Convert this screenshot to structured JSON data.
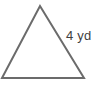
{
  "figure": {
    "background_color": "#ffffff",
    "shape": {
      "name": "triangle",
      "kind": "isosceles",
      "stroke_color": "#6b6b6b",
      "stroke_width": 2,
      "fill": "none",
      "vertices": [
        {
          "name": "apex",
          "x": 40,
          "y": 6
        },
        {
          "name": "bottom-right",
          "x": 84,
          "y": 78
        },
        {
          "name": "bottom-left",
          "x": 2,
          "y": 78
        }
      ]
    },
    "labels": [
      {
        "name": "right-side-length",
        "text": "4 yd",
        "value": 4,
        "unit": "yd",
        "color": "#3f3f3f",
        "font_size_px": 13,
        "x": 66,
        "y": 29,
        "refers_to": "right-slanted-side"
      }
    ]
  },
  "chart_data": {
    "type": "diagram",
    "shapes": [
      {
        "type": "polygon",
        "label": "triangle",
        "points": [
          [
            40,
            6
          ],
          [
            84,
            78
          ],
          [
            2,
            78
          ]
        ],
        "stroke": "#6b6b6b",
        "stroke_width": 2,
        "fill": "none"
      }
    ],
    "annotations": [
      {
        "text": "4 yd",
        "value": 4,
        "unit": "yd",
        "position": [
          66,
          29
        ],
        "target": "right-slanted-side"
      }
    ]
  }
}
